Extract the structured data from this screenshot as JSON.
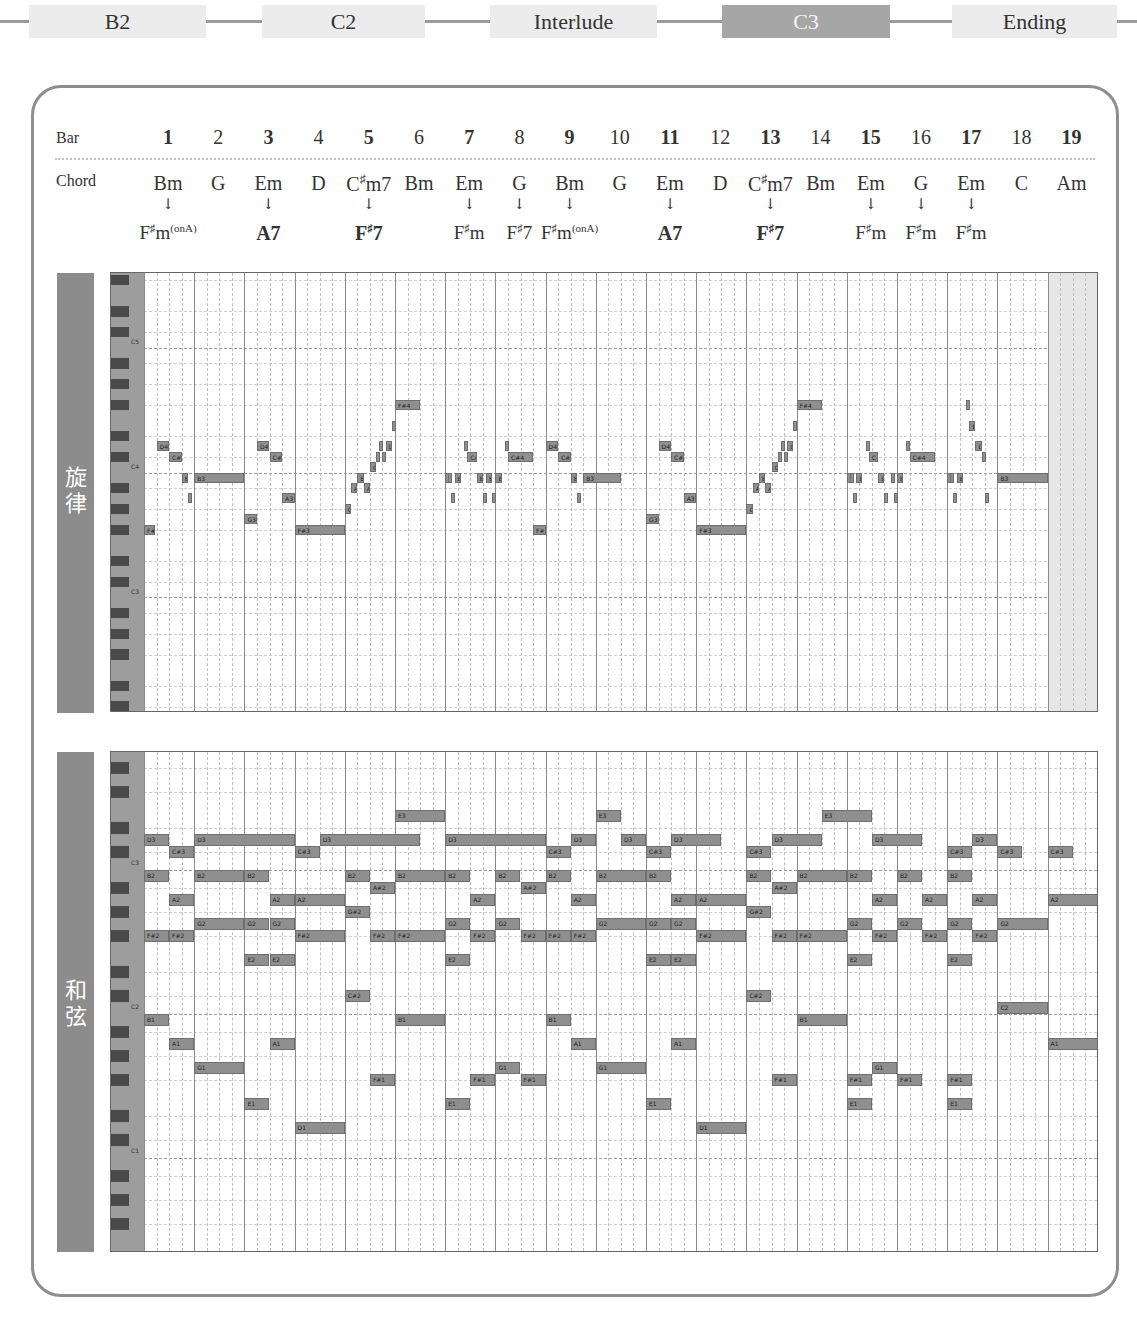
{
  "nav": {
    "sections": [
      {
        "label": "B2",
        "left": 29,
        "width": 177,
        "active": false
      },
      {
        "label": "C2",
        "left": 262,
        "width": 163,
        "active": false
      },
      {
        "label": "Interlude",
        "left": 490,
        "width": 167,
        "active": false
      },
      {
        "label": "C3",
        "left": 722,
        "width": 168,
        "active": true
      },
      {
        "label": "Ending",
        "left": 952,
        "width": 165,
        "active": false
      }
    ],
    "colors": {
      "box": "#ececec",
      "active_box": "#a6a6a6",
      "line": "#9a9a9a"
    }
  },
  "header": {
    "bar_label": "Bar",
    "chord_label": "Chord",
    "bars": [
      "1",
      "2",
      "3",
      "4",
      "5",
      "6",
      "7",
      "8",
      "9",
      "10",
      "11",
      "12",
      "13",
      "14",
      "15",
      "16",
      "17",
      "18",
      "19"
    ],
    "chords": [
      "Bm",
      "G",
      "Em",
      "D",
      "C#m7",
      "Bm",
      "Em",
      "G",
      "Bm",
      "G",
      "Em",
      "D",
      "C#m7",
      "Bm",
      "Em",
      "G",
      "Em",
      "C",
      "Am"
    ],
    "substitutions": [
      {
        "bar": 1,
        "label": "F#m(onA)"
      },
      {
        "bar": 3,
        "label": "A7"
      },
      {
        "bar": 5,
        "label": "F#7"
      },
      {
        "bar": 7,
        "label": "F#m"
      },
      {
        "bar": 8,
        "label": "F#7"
      },
      {
        "bar": 9,
        "label": "F#m(onA)"
      },
      {
        "bar": 11,
        "label": "A7"
      },
      {
        "bar": 13,
        "label": "F#7"
      },
      {
        "bar": 15,
        "label": "F#m"
      },
      {
        "bar": 16,
        "label": "F#m"
      },
      {
        "bar": 17,
        "label": "F#m"
      }
    ],
    "arrow": "↓"
  },
  "melody": {
    "title": "旋律",
    "title_chars": [
      "旋",
      "律"
    ],
    "octave_labels": [
      {
        "label": "C5",
        "midi": 72
      },
      {
        "label": "C4",
        "midi": 60
      },
      {
        "label": "C3",
        "midi": 48
      }
    ],
    "notes": [
      {
        "s": 0,
        "d": 0.9,
        "m": 54,
        "l": "F#3"
      },
      {
        "s": 1,
        "d": 1,
        "m": 62,
        "l": "D4"
      },
      {
        "s": 2,
        "d": 1,
        "m": 61,
        "l": "C#4"
      },
      {
        "s": 3,
        "d": 0.5,
        "m": 59,
        "l": "B3"
      },
      {
        "s": 3.5,
        "d": 0.25,
        "m": 57,
        "l": "A"
      },
      {
        "s": 4,
        "d": 4,
        "m": 59,
        "l": "B3"
      },
      {
        "s": 8,
        "d": 1,
        "m": 55,
        "l": "G3"
      },
      {
        "s": 9,
        "d": 1,
        "m": 62,
        "l": "D4"
      },
      {
        "s": 10,
        "d": 1,
        "m": 61,
        "l": "C#4"
      },
      {
        "s": 11,
        "d": 1,
        "m": 57,
        "l": "A3"
      },
      {
        "s": 12,
        "d": 4,
        "m": 54,
        "l": "F#3"
      },
      {
        "s": 16,
        "d": 0.5,
        "m": 56,
        "l": "G#"
      },
      {
        "s": 16.5,
        "d": 0.5,
        "m": 58,
        "l": "A"
      },
      {
        "s": 17,
        "d": 0.5,
        "m": 59,
        "l": "B"
      },
      {
        "s": 17.5,
        "d": 0.5,
        "m": 58,
        "l": "A"
      },
      {
        "s": 18,
        "d": 0.5,
        "m": 60,
        "l": "C#"
      },
      {
        "s": 18.5,
        "d": 0.25,
        "m": 61,
        "l": "C"
      },
      {
        "s": 18.75,
        "d": 0.25,
        "m": 62,
        "l": "D"
      },
      {
        "s": 19,
        "d": 0.25,
        "m": 61,
        "l": "E"
      },
      {
        "s": 19.25,
        "d": 0.5,
        "m": 62,
        "l": "D"
      },
      {
        "s": 19.75,
        "d": 0.25,
        "m": 64,
        "l": "E"
      },
      {
        "s": 20,
        "d": 2,
        "m": 66,
        "l": "F#4"
      },
      {
        "s": 24,
        "d": 0.25,
        "m": 59,
        "l": "B"
      },
      {
        "s": 24.25,
        "d": 0.25,
        "m": 59,
        "l": "B"
      },
      {
        "s": 24.5,
        "d": 0.25,
        "m": 57,
        "l": "A"
      },
      {
        "s": 24.75,
        "d": 0.5,
        "m": 59,
        "l": "B"
      },
      {
        "s": 25.5,
        "d": 0.25,
        "m": 62,
        "l": "D"
      },
      {
        "s": 25.75,
        "d": 0.75,
        "m": 61,
        "l": "C#C"
      },
      {
        "s": 26.5,
        "d": 0.5,
        "m": 59,
        "l": "B"
      },
      {
        "s": 27,
        "d": 0.25,
        "m": 57,
        "l": "A"
      },
      {
        "s": 27.25,
        "d": 0.5,
        "m": 59,
        "l": "B"
      },
      {
        "s": 27.75,
        "d": 0.25,
        "m": 57,
        "l": "A"
      },
      {
        "s": 28,
        "d": 0.5,
        "m": 59,
        "l": "B"
      },
      {
        "s": 28.75,
        "d": 0.25,
        "m": 62,
        "l": "D"
      },
      {
        "s": 29,
        "d": 2,
        "m": 61,
        "l": "C#4"
      },
      {
        "s": 31,
        "d": 1,
        "m": 54,
        "l": "F#3"
      },
      {
        "s": 32,
        "d": 1,
        "m": 62,
        "l": "D4"
      },
      {
        "s": 33,
        "d": 1,
        "m": 61,
        "l": "C#4"
      },
      {
        "s": 34,
        "d": 0.5,
        "m": 59,
        "l": "B3"
      },
      {
        "s": 34.5,
        "d": 0.25,
        "m": 57,
        "l": "A"
      },
      {
        "s": 35,
        "d": 3,
        "m": 59,
        "l": "B3"
      },
      {
        "s": 40,
        "d": 1,
        "m": 55,
        "l": "G3"
      },
      {
        "s": 41,
        "d": 1,
        "m": 62,
        "l": "D4"
      },
      {
        "s": 42,
        "d": 1,
        "m": 61,
        "l": "C#4"
      },
      {
        "s": 43,
        "d": 1,
        "m": 57,
        "l": "A3"
      },
      {
        "s": 44,
        "d": 4,
        "m": 54,
        "l": "F#3"
      },
      {
        "s": 48,
        "d": 0.5,
        "m": 56,
        "l": "G#"
      },
      {
        "s": 48.5,
        "d": 0.5,
        "m": 58,
        "l": "A"
      },
      {
        "s": 49,
        "d": 0.5,
        "m": 59,
        "l": "B"
      },
      {
        "s": 49.5,
        "d": 0.5,
        "m": 58,
        "l": "A"
      },
      {
        "s": 50,
        "d": 0.5,
        "m": 60,
        "l": "C#"
      },
      {
        "s": 50.5,
        "d": 0.25,
        "m": 61,
        "l": "C"
      },
      {
        "s": 50.75,
        "d": 0.25,
        "m": 62,
        "l": "D"
      },
      {
        "s": 51,
        "d": 0.25,
        "m": 61,
        "l": "E"
      },
      {
        "s": 51.25,
        "d": 0.5,
        "m": 62,
        "l": "D"
      },
      {
        "s": 51.75,
        "d": 0.25,
        "m": 64,
        "l": "E"
      },
      {
        "s": 52,
        "d": 2,
        "m": 66,
        "l": "F#4"
      },
      {
        "s": 56,
        "d": 0.25,
        "m": 59,
        "l": "B"
      },
      {
        "s": 56.25,
        "d": 0.25,
        "m": 59,
        "l": "B"
      },
      {
        "s": 56.5,
        "d": 0.25,
        "m": 57,
        "l": "A"
      },
      {
        "s": 56.75,
        "d": 0.5,
        "m": 59,
        "l": "B"
      },
      {
        "s": 57.5,
        "d": 0.25,
        "m": 62,
        "l": "D"
      },
      {
        "s": 57.75,
        "d": 0.75,
        "m": 61,
        "l": "C#C"
      },
      {
        "s": 58.5,
        "d": 0.5,
        "m": 59,
        "l": "B"
      },
      {
        "s": 59,
        "d": 0.25,
        "m": 57,
        "l": "A"
      },
      {
        "s": 59.5,
        "d": 0.25,
        "m": 59,
        "l": "B"
      },
      {
        "s": 59.75,
        "d": 0.25,
        "m": 57,
        "l": "A"
      },
      {
        "s": 60,
        "d": 0.5,
        "m": 59,
        "l": "B"
      },
      {
        "s": 60.75,
        "d": 0.25,
        "m": 62,
        "l": "D"
      },
      {
        "s": 61,
        "d": 2,
        "m": 61,
        "l": "C#4"
      },
      {
        "s": 64,
        "d": 0.25,
        "m": 59,
        "l": "B"
      },
      {
        "s": 64.25,
        "d": 0.25,
        "m": 59,
        "l": "B"
      },
      {
        "s": 64.5,
        "d": 0.25,
        "m": 57,
        "l": "A"
      },
      {
        "s": 64.75,
        "d": 0.5,
        "m": 59,
        "l": "B"
      },
      {
        "s": 65.5,
        "d": 0.25,
        "m": 66,
        "l": "F#"
      },
      {
        "s": 65.75,
        "d": 0.5,
        "m": 64,
        "l": "E4"
      },
      {
        "s": 66.25,
        "d": 0.5,
        "m": 62,
        "l": "D"
      },
      {
        "s": 66.75,
        "d": 0.25,
        "m": 61,
        "l": "C"
      },
      {
        "s": 67,
        "d": 0.25,
        "m": 57,
        "l": "A"
      },
      {
        "s": 68,
        "d": 4,
        "m": 59,
        "l": "B3"
      }
    ]
  },
  "harmony": {
    "title": "和弦",
    "title_chars": [
      "和",
      "弦"
    ],
    "octave_labels": [
      {
        "label": "C3",
        "midi": 48
      },
      {
        "label": "C2",
        "midi": 36
      },
      {
        "label": "C1",
        "midi": 24
      }
    ],
    "notes": [
      {
        "s": 0,
        "d": 2,
        "m": 50,
        "l": "D3"
      },
      {
        "s": 2,
        "d": 2,
        "m": 49,
        "l": "C#3"
      },
      {
        "s": 4,
        "d": 8,
        "m": 50,
        "l": "D3"
      },
      {
        "s": 12,
        "d": 2,
        "m": 49,
        "l": "C#3"
      },
      {
        "s": 14,
        "d": 8,
        "m": 50,
        "l": "D3"
      },
      {
        "s": 20,
        "d": 4,
        "m": 52,
        "l": "E3"
      },
      {
        "s": 24,
        "d": 8,
        "m": 50,
        "l": "D3"
      },
      {
        "s": 32,
        "d": 2,
        "m": 49,
        "l": "C#3"
      },
      {
        "s": 34,
        "d": 2,
        "m": 50,
        "l": "D3"
      },
      {
        "s": 36,
        "d": 2,
        "m": 52,
        "l": "E3"
      },
      {
        "s": 38,
        "d": 2,
        "m": 50,
        "l": "D3"
      },
      {
        "s": 40,
        "d": 2,
        "m": 49,
        "l": "C#3"
      },
      {
        "s": 42,
        "d": 4,
        "m": 50,
        "l": "D3"
      },
      {
        "s": 48,
        "d": 2,
        "m": 49,
        "l": "C#3"
      },
      {
        "s": 50,
        "d": 4,
        "m": 50,
        "l": "D3"
      },
      {
        "s": 54,
        "d": 4,
        "m": 52,
        "l": "E3"
      },
      {
        "s": 58,
        "d": 4,
        "m": 50,
        "l": "D3"
      },
      {
        "s": 64,
        "d": 2,
        "m": 49,
        "l": "C#3"
      },
      {
        "s": 66,
        "d": 2,
        "m": 50,
        "l": "D3"
      },
      {
        "s": 68,
        "d": 2,
        "m": 49,
        "l": "C#3"
      },
      {
        "s": 72,
        "d": 2,
        "m": 49,
        "l": "C#3"
      },
      {
        "s": 76,
        "d": 4,
        "m": 52,
        "l": "E3"
      },
      {
        "s": 80,
        "d": 4,
        "m": 52,
        "l": "E3"
      },
      {
        "s": 76,
        "d": 4,
        "m": 48,
        "l": "C3"
      },
      {
        "s": 80,
        "d": 4,
        "m": 48,
        "l": "C3"
      },
      {
        "s": 0,
        "d": 2,
        "m": 47,
        "l": "B2"
      },
      {
        "s": 2,
        "d": 2,
        "m": 45,
        "l": "A2"
      },
      {
        "s": 4,
        "d": 4,
        "m": 47,
        "l": "B2"
      },
      {
        "s": 8,
        "d": 2,
        "m": 47,
        "l": "B2"
      },
      {
        "s": 10,
        "d": 2,
        "m": 45,
        "l": "A2"
      },
      {
        "s": 12,
        "d": 4,
        "m": 45,
        "l": "A2"
      },
      {
        "s": 16,
        "d": 2,
        "m": 47,
        "l": "B2"
      },
      {
        "s": 18,
        "d": 2,
        "m": 46,
        "l": "A#2"
      },
      {
        "s": 16,
        "d": 2,
        "m": 44,
        "l": "G#2"
      },
      {
        "s": 20,
        "d": 4,
        "m": 47,
        "l": "B2"
      },
      {
        "s": 24,
        "d": 2,
        "m": 47,
        "l": "B2"
      },
      {
        "s": 26,
        "d": 2,
        "m": 45,
        "l": "A2"
      },
      {
        "s": 28,
        "d": 2,
        "m": 47,
        "l": "B2"
      },
      {
        "s": 30,
        "d": 2,
        "m": 46,
        "l": "A#2"
      },
      {
        "s": 32,
        "d": 2,
        "m": 47,
        "l": "B2"
      },
      {
        "s": 34,
        "d": 2,
        "m": 45,
        "l": "A2"
      },
      {
        "s": 36,
        "d": 4,
        "m": 47,
        "l": "B2"
      },
      {
        "s": 40,
        "d": 2,
        "m": 47,
        "l": "B2"
      },
      {
        "s": 42,
        "d": 2,
        "m": 45,
        "l": "A2"
      },
      {
        "s": 44,
        "d": 4,
        "m": 45,
        "l": "A2"
      },
      {
        "s": 48,
        "d": 2,
        "m": 47,
        "l": "B2"
      },
      {
        "s": 50,
        "d": 2,
        "m": 46,
        "l": "A#2"
      },
      {
        "s": 48,
        "d": 2,
        "m": 44,
        "l": "G#2"
      },
      {
        "s": 52,
        "d": 4,
        "m": 47,
        "l": "B2"
      },
      {
        "s": 56,
        "d": 2,
        "m": 47,
        "l": "B2"
      },
      {
        "s": 58,
        "d": 2,
        "m": 45,
        "l": "A2"
      },
      {
        "s": 60,
        "d": 2,
        "m": 47,
        "l": "B2"
      },
      {
        "s": 62,
        "d": 2,
        "m": 45,
        "l": "A2"
      },
      {
        "s": 64,
        "d": 2,
        "m": 47,
        "l": "B2"
      },
      {
        "s": 66,
        "d": 2,
        "m": 45,
        "l": "A2"
      },
      {
        "s": 72,
        "d": 4,
        "m": 45,
        "l": "A2"
      },
      {
        "s": 0,
        "d": 2,
        "m": 42,
        "l": "F#2"
      },
      {
        "s": 2,
        "d": 2,
        "m": 42,
        "l": "F#2"
      },
      {
        "s": 4,
        "d": 4,
        "m": 43,
        "l": "G2"
      },
      {
        "s": 8,
        "d": 2,
        "m": 43,
        "l": "G2"
      },
      {
        "s": 10,
        "d": 2,
        "m": 43,
        "l": "G2"
      },
      {
        "s": 12,
        "d": 4,
        "m": 42,
        "l": "F#2"
      },
      {
        "s": 18,
        "d": 2,
        "m": 42,
        "l": "F#2"
      },
      {
        "s": 20,
        "d": 4,
        "m": 42,
        "l": "F#2"
      },
      {
        "s": 24,
        "d": 2,
        "m": 43,
        "l": "G2"
      },
      {
        "s": 26,
        "d": 2,
        "m": 42,
        "l": "F#2"
      },
      {
        "s": 28,
        "d": 2,
        "m": 43,
        "l": "G2"
      },
      {
        "s": 30,
        "d": 2,
        "m": 42,
        "l": "F#2"
      },
      {
        "s": 32,
        "d": 2,
        "m": 42,
        "l": "F#2"
      },
      {
        "s": 34,
        "d": 2,
        "m": 42,
        "l": "F#2"
      },
      {
        "s": 36,
        "d": 4,
        "m": 43,
        "l": "G2"
      },
      {
        "s": 40,
        "d": 2,
        "m": 43,
        "l": "G2"
      },
      {
        "s": 42,
        "d": 2,
        "m": 43,
        "l": "G2"
      },
      {
        "s": 44,
        "d": 4,
        "m": 42,
        "l": "F#2"
      },
      {
        "s": 50,
        "d": 2,
        "m": 42,
        "l": "F#2"
      },
      {
        "s": 52,
        "d": 4,
        "m": 42,
        "l": "F#2"
      },
      {
        "s": 56,
        "d": 2,
        "m": 43,
        "l": "G2"
      },
      {
        "s": 58,
        "d": 2,
        "m": 42,
        "l": "F#2"
      },
      {
        "s": 60,
        "d": 2,
        "m": 43,
        "l": "G2"
      },
      {
        "s": 62,
        "d": 2,
        "m": 42,
        "l": "F#2"
      },
      {
        "s": 64,
        "d": 2,
        "m": 43,
        "l": "G2"
      },
      {
        "s": 66,
        "d": 2,
        "m": 42,
        "l": "F#2"
      },
      {
        "s": 68,
        "d": 4,
        "m": 43,
        "l": "G2"
      },
      {
        "s": 8,
        "d": 2,
        "m": 40,
        "l": "E2"
      },
      {
        "s": 10,
        "d": 2,
        "m": 40,
        "l": "E2"
      },
      {
        "s": 16,
        "d": 2,
        "m": 37,
        "l": "C#2"
      },
      {
        "s": 24,
        "d": 2,
        "m": 40,
        "l": "E2"
      },
      {
        "s": 40,
        "d": 2,
        "m": 40,
        "l": "E2"
      },
      {
        "s": 42,
        "d": 2,
        "m": 40,
        "l": "E2"
      },
      {
        "s": 48,
        "d": 2,
        "m": 37,
        "l": "C#2"
      },
      {
        "s": 56,
        "d": 2,
        "m": 40,
        "l": "E2"
      },
      {
        "s": 64,
        "d": 2,
        "m": 40,
        "l": "E2"
      },
      {
        "s": 68,
        "d": 4,
        "m": 36,
        "l": "C2"
      },
      {
        "s": 0,
        "d": 2,
        "m": 35,
        "l": "B1"
      },
      {
        "s": 2,
        "d": 2,
        "m": 33,
        "l": "A1"
      },
      {
        "s": 4,
        "d": 4,
        "m": 31,
        "l": "G1"
      },
      {
        "s": 10,
        "d": 2,
        "m": 33,
        "l": "A1"
      },
      {
        "s": 8,
        "d": 2,
        "m": 28,
        "l": "E1"
      },
      {
        "s": 12,
        "d": 4,
        "m": 26,
        "l": "D1"
      },
      {
        "s": 18,
        "d": 2,
        "m": 30,
        "l": "F#1"
      },
      {
        "s": 20,
        "d": 4,
        "m": 35,
        "l": "B1"
      },
      {
        "s": 24,
        "d": 2,
        "m": 28,
        "l": "E1"
      },
      {
        "s": 26,
        "d": 2,
        "m": 30,
        "l": "F#1"
      },
      {
        "s": 28,
        "d": 2,
        "m": 31,
        "l": "G1"
      },
      {
        "s": 30,
        "d": 2,
        "m": 30,
        "l": "F#1"
      },
      {
        "s": 32,
        "d": 2,
        "m": 35,
        "l": "B1"
      },
      {
        "s": 34,
        "d": 2,
        "m": 33,
        "l": "A1"
      },
      {
        "s": 36,
        "d": 4,
        "m": 31,
        "l": "G1"
      },
      {
        "s": 40,
        "d": 2,
        "m": 28,
        "l": "E1"
      },
      {
        "s": 42,
        "d": 2,
        "m": 33,
        "l": "A1"
      },
      {
        "s": 44,
        "d": 4,
        "m": 26,
        "l": "D1"
      },
      {
        "s": 50,
        "d": 2,
        "m": 30,
        "l": "F#1"
      },
      {
        "s": 52,
        "d": 4,
        "m": 35,
        "l": "B1"
      },
      {
        "s": 56,
        "d": 2,
        "m": 28,
        "l": "E1"
      },
      {
        "s": 56,
        "d": 2,
        "m": 30,
        "l": "F#1"
      },
      {
        "s": 58,
        "d": 2,
        "m": 31,
        "l": "G1"
      },
      {
        "s": 60,
        "d": 2,
        "m": 30,
        "l": "F#1"
      },
      {
        "s": 64,
        "d": 2,
        "m": 28,
        "l": "E1"
      },
      {
        "s": 64,
        "d": 2,
        "m": 30,
        "l": "F#1"
      },
      {
        "s": 72,
        "d": 4,
        "m": 33,
        "l": "A1"
      }
    ]
  }
}
